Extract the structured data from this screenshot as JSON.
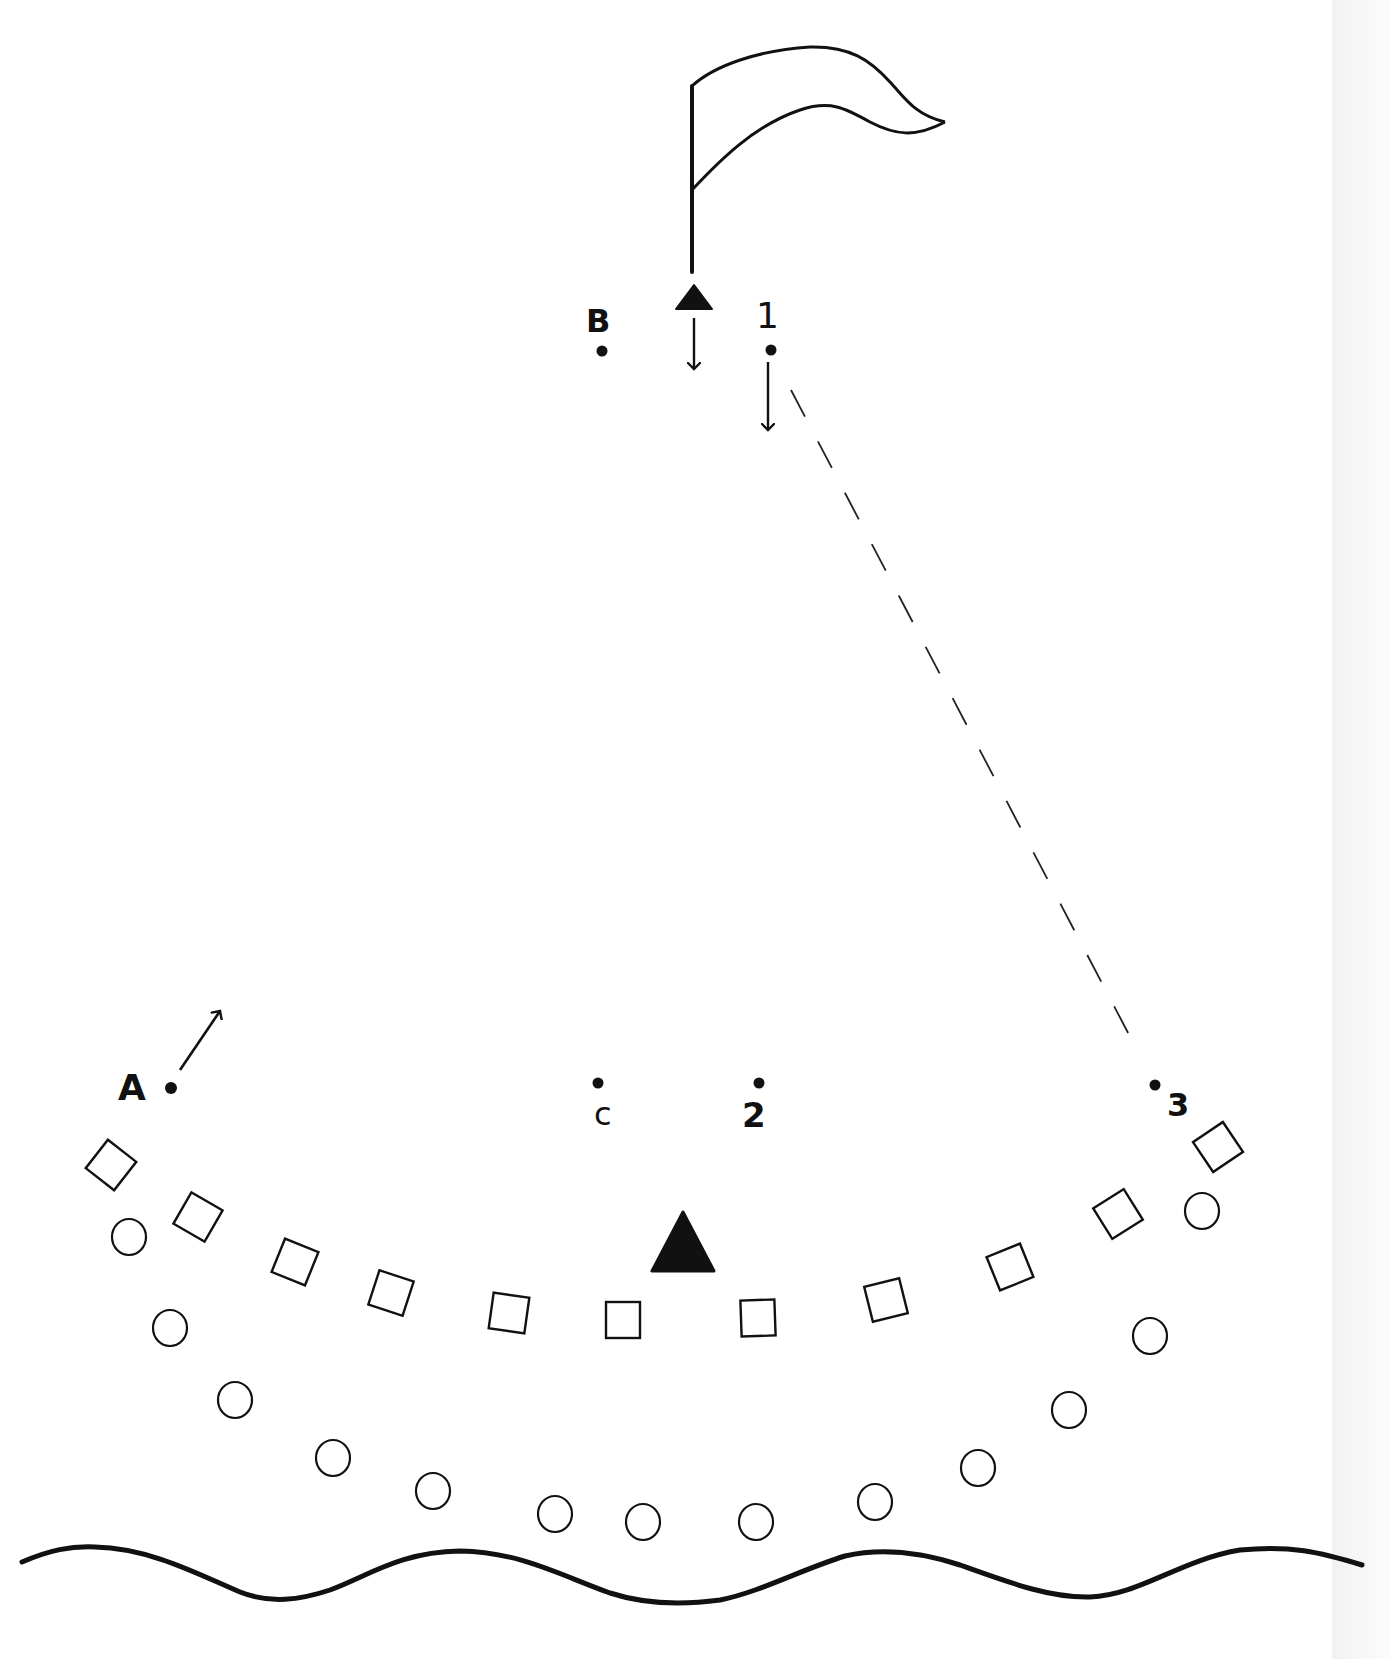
{
  "diagram": {
    "type": "drill-field-diagram",
    "stroke_color": "#111111",
    "background": "#ffffff",
    "labels": {
      "A": "A",
      "B": "B",
      "C": "C",
      "one": "1",
      "two": "2",
      "three": "3"
    },
    "flag": {
      "pole_x": 692,
      "pole_top": 85,
      "pole_bottom": 272
    },
    "players": [
      {
        "id": "A",
        "x": 171,
        "y": 1088
      },
      {
        "id": "B",
        "x": 602,
        "y": 351
      },
      {
        "id": "C",
        "x": 598,
        "y": 1083
      },
      {
        "id": "1",
        "x": 771,
        "y": 350
      },
      {
        "id": "2",
        "x": 759,
        "y": 1083
      },
      {
        "id": "3",
        "x": 1155,
        "y": 1085
      }
    ],
    "cones": [
      {
        "id": "top-cone",
        "x": 694,
        "y": 297,
        "size": "small"
      },
      {
        "id": "center-cone",
        "x": 682,
        "y": 1243,
        "size": "large"
      }
    ],
    "squares": [
      {
        "x": 111,
        "y": 1165,
        "rot": 38
      },
      {
        "x": 198,
        "y": 1217,
        "rot": 30
      },
      {
        "x": 295,
        "y": 1262,
        "rot": 22
      },
      {
        "x": 391,
        "y": 1293,
        "rot": 18
      },
      {
        "x": 509,
        "y": 1313,
        "rot": 8
      },
      {
        "x": 623,
        "y": 1320,
        "rot": 0
      },
      {
        "x": 758,
        "y": 1318,
        "rot": -2
      },
      {
        "x": 886,
        "y": 1300,
        "rot": -14
      },
      {
        "x": 1010,
        "y": 1267,
        "rot": -22
      },
      {
        "x": 1118,
        "y": 1214,
        "rot": -32
      },
      {
        "x": 1218,
        "y": 1147,
        "rot": -34
      }
    ],
    "circles": [
      {
        "x": 129,
        "y": 1237
      },
      {
        "x": 170,
        "y": 1328
      },
      {
        "x": 235,
        "y": 1400
      },
      {
        "x": 333,
        "y": 1458
      },
      {
        "x": 433,
        "y": 1491
      },
      {
        "x": 555,
        "y": 1514
      },
      {
        "x": 643,
        "y": 1522
      },
      {
        "x": 756,
        "y": 1522
      },
      {
        "x": 875,
        "y": 1502
      },
      {
        "x": 978,
        "y": 1468
      },
      {
        "x": 1069,
        "y": 1410
      },
      {
        "x": 1150,
        "y": 1336
      },
      {
        "x": 1202,
        "y": 1211
      }
    ],
    "dashed_path": {
      "from": [
        791,
        390
      ],
      "to": [
        1136,
        1048
      ]
    },
    "movement_arrows": [
      {
        "id": "cone-down",
        "from": [
          694,
          318
        ],
        "to": [
          694,
          370
        ]
      },
      {
        "id": "player1-down",
        "from": [
          768,
          362
        ],
        "to": [
          768,
          430
        ]
      },
      {
        "id": "playerA-diagonal",
        "from": [
          180,
          1070
        ],
        "to": [
          221,
          1010
        ]
      }
    ]
  }
}
